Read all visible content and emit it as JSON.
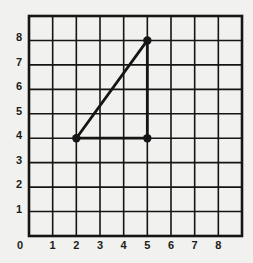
{
  "chart_data": {
    "type": "scatter",
    "title": "",
    "xlabel": "",
    "ylabel": "",
    "xlim": [
      0,
      9
    ],
    "ylim": [
      0,
      9
    ],
    "grid": true,
    "origin_label": "0",
    "x_ticks": [
      "1",
      "2",
      "3",
      "4",
      "5",
      "6",
      "7",
      "8"
    ],
    "y_ticks": [
      "1",
      "2",
      "3",
      "4",
      "5",
      "6",
      "7",
      "8"
    ],
    "points": [
      {
        "x": 2,
        "y": 4
      },
      {
        "x": 5,
        "y": 8
      },
      {
        "x": 5,
        "y": 4
      }
    ],
    "segments": [
      {
        "from": [
          2,
          4
        ],
        "to": [
          5,
          8
        ]
      },
      {
        "from": [
          5,
          8
        ],
        "to": [
          5,
          4
        ]
      },
      {
        "from": [
          2,
          4
        ],
        "to": [
          5,
          4
        ]
      }
    ],
    "shape": "right triangle"
  },
  "colors": {
    "ink": "#151515",
    "paper": "#f1f1ef"
  }
}
